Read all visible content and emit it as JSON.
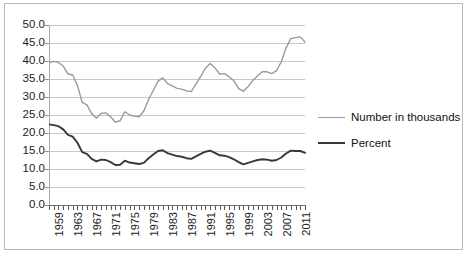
{
  "chart_data": {
    "type": "line",
    "title": "",
    "subtitle": "",
    "xlabel": "",
    "ylabel": "",
    "grid": true,
    "legend_position": "right",
    "ylim": [
      0.0,
      50.0
    ],
    "ytick_labels": [
      "50.0",
      "45.0",
      "40.0",
      "35.0",
      "30.0",
      "25.0",
      "20.0",
      "15.0",
      "10.0",
      "5.0",
      "0.0"
    ],
    "ytick_values": [
      50.0,
      45.0,
      40.0,
      35.0,
      30.0,
      25.0,
      20.0,
      15.0,
      10.0,
      5.0,
      0.0
    ],
    "xtick_labels": [
      "1959",
      "1963",
      "1967",
      "1971",
      "1975",
      "1979",
      "1983",
      "1987",
      "1991",
      "1995",
      "1999",
      "2003",
      "2007",
      "2011"
    ],
    "x": [
      1959,
      1960,
      1961,
      1962,
      1963,
      1964,
      1965,
      1966,
      1967,
      1968,
      1969,
      1970,
      1971,
      1972,
      1973,
      1974,
      1975,
      1976,
      1977,
      1978,
      1979,
      1980,
      1981,
      1982,
      1983,
      1984,
      1985,
      1986,
      1987,
      1988,
      1989,
      1990,
      1991,
      1992,
      1993,
      1994,
      1995,
      1996,
      1997,
      1998,
      1999,
      2000,
      2001,
      2002,
      2003,
      2004,
      2005,
      2006,
      2007,
      2008,
      2009,
      2010,
      2011,
      2012,
      2013
    ],
    "series": [
      {
        "name": "Number in thousands",
        "color": "#9a9a9a",
        "values": [
          39.5,
          39.9,
          39.6,
          38.6,
          36.4,
          36.1,
          33.2,
          28.5,
          27.8,
          25.4,
          24.1,
          25.4,
          25.6,
          24.5,
          23.0,
          23.4,
          25.9,
          25.0,
          24.7,
          24.5,
          26.1,
          29.3,
          31.8,
          34.4,
          35.3,
          33.7,
          33.1,
          32.4,
          32.2,
          31.7,
          31.5,
          33.6,
          35.7,
          38.0,
          39.3,
          38.1,
          36.4,
          36.5,
          35.6,
          34.5,
          32.3,
          31.6,
          32.9,
          34.6,
          35.9,
          37.0,
          37.0,
          36.5,
          37.3,
          39.8,
          43.6,
          46.2,
          46.5,
          46.7,
          45.3
        ]
      },
      {
        "name": "Percent",
        "color": "#383838",
        "values": [
          22.4,
          22.2,
          21.9,
          21.0,
          19.5,
          19.0,
          17.3,
          14.7,
          14.2,
          12.8,
          12.1,
          12.6,
          12.5,
          11.9,
          11.1,
          11.2,
          12.3,
          11.8,
          11.6,
          11.4,
          11.7,
          13.0,
          14.0,
          15.0,
          15.2,
          14.4,
          14.0,
          13.6,
          13.4,
          13.0,
          12.8,
          13.5,
          14.2,
          14.8,
          15.1,
          14.5,
          13.8,
          13.7,
          13.3,
          12.7,
          11.9,
          11.3,
          11.7,
          12.1,
          12.5,
          12.7,
          12.6,
          12.3,
          12.5,
          13.2,
          14.3,
          15.1,
          15.0,
          15.0,
          14.5
        ]
      }
    ]
  },
  "legend": {
    "entries": [
      {
        "label": "Number in thousands",
        "color": "#9a9a9a"
      },
      {
        "label": "Percent",
        "color": "#383838"
      }
    ]
  }
}
